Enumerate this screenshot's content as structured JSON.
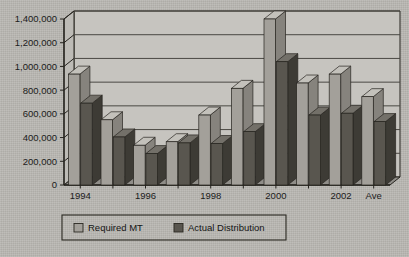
{
  "chart_data": {
    "type": "bar",
    "title": "",
    "xlabel": "",
    "ylabel": "",
    "ylim": [
      0,
      1400000
    ],
    "grid": true,
    "legend_position": "bottom",
    "categories": [
      "1994",
      "1995",
      "1996",
      "1997",
      "1998",
      "1999",
      "2000",
      "2001",
      "2002",
      "Ave"
    ],
    "xtick_labels": [
      "1994",
      "",
      "1996",
      "",
      "1998",
      "",
      "2000",
      "",
      "2002",
      "Ave"
    ],
    "ytick_labels": [
      "0",
      "200,000",
      "400,000",
      "600,000",
      "800,000",
      "1,000,000",
      "1,200,000",
      "1,400,000"
    ],
    "ytick_values": [
      0,
      200000,
      400000,
      600000,
      800000,
      1000000,
      1200000,
      1400000
    ],
    "series": [
      {
        "name": "Required MT",
        "color": "#a3a09a",
        "values": [
          935000,
          550000,
          335000,
          365000,
          590000,
          815000,
          1400000,
          860000,
          935000,
          745000
        ]
      },
      {
        "name": "Actual Distribution",
        "color": "#59564f",
        "values": [
          690000,
          405000,
          265000,
          355000,
          350000,
          450000,
          1040000,
          590000,
          605000,
          535000
        ]
      }
    ]
  },
  "legend": {
    "items": [
      {
        "label": "Required MT",
        "swatch": "light-gray-swatch"
      },
      {
        "label": "Actual Distribution",
        "swatch": "dark-gray-swatch"
      }
    ]
  },
  "colors": {
    "page_background": "#bab8b3",
    "plot_background": "#c6c4bf",
    "axis_line": "#26241f",
    "gridline": "#4a4843",
    "series_light": "#a3a09a",
    "series_dark": "#59564f",
    "text": "#1b1b1b"
  }
}
